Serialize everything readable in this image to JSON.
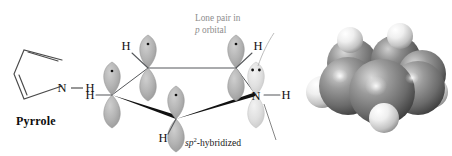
{
  "figure": {
    "caption_left": "Pyrrole",
    "structure_2d": {
      "ring_atoms": [
        "C",
        "C",
        "C",
        "C",
        "N"
      ],
      "heteroatom_label": "N",
      "nh_hydrogen_label": "H",
      "bond_style": "skeletal-line",
      "double_bonds": 2
    },
    "orbital_diagram": {
      "hydrogen_labels": [
        "H",
        "H",
        "H",
        "H"
      ],
      "nitrogen_label": "N",
      "nitrogen_hydrogen_label": "H",
      "annotations": [
        {
          "id": "lone-pair-callout",
          "line1": "Lone pair in",
          "line2_italic": "p",
          "line2_rest": " orbital"
        },
        {
          "id": "hybridization-callout",
          "italic": "sp",
          "superscript": "2",
          "rest": "-hybridized"
        }
      ],
      "p_orbital_electron_dots": [
        1,
        1,
        1,
        1
      ],
      "lone_pair_dots": 2
    },
    "space_filling_model": {
      "carbon_sphere_color": "#6f6f6f",
      "nitrogen_sphere_color": "#5c5c5c",
      "hydrogen_sphere_color": "#e8e8e8",
      "carbon_count": 4,
      "nitrogen_count": 1,
      "hydrogen_count": 5
    },
    "colors": {
      "orbital_carbon_fill": "#b3b3b3",
      "orbital_nitrogen_fill": "#dedede",
      "bond_line": "#4a4a4a",
      "wedge_bond": "#111111",
      "callout_text": "#8d8d8d",
      "background": "#ffffff"
    }
  }
}
